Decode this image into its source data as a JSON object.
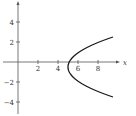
{
  "chart_data": {
    "type": "line",
    "title": "",
    "xlabel": "x",
    "ylabel": "y",
    "xlim": [
      -1.5,
      10
    ],
    "ylim": [
      -5,
      5.5
    ],
    "grid": false,
    "x_ticks": [
      2,
      4,
      6,
      8
    ],
    "y_ticks": [
      4,
      2,
      -2,
      -4
    ],
    "x_tick_labels": [
      "2",
      "4",
      "6",
      "8"
    ],
    "y_tick_labels": [
      "4",
      "2",
      "−2",
      "−4"
    ],
    "series": [
      {
        "name": "parabola",
        "equation": "x = (1/2)(y + 1/2)^2 + 5",
        "vertex": [
          5,
          -0.5
        ],
        "points": [
          {
            "x": 9.5,
            "y": 2.5
          },
          {
            "x": 8.125,
            "y": 2
          },
          {
            "x": 6.125,
            "y": 1
          },
          {
            "x": 5.125,
            "y": 0
          },
          {
            "x": 5,
            "y": -0.5
          },
          {
            "x": 5.125,
            "y": -1
          },
          {
            "x": 6.125,
            "y": -2
          },
          {
            "x": 8.125,
            "y": -3
          },
          {
            "x": 9.5,
            "y": -3.5
          }
        ],
        "color": "#1a1a1a"
      }
    ]
  }
}
